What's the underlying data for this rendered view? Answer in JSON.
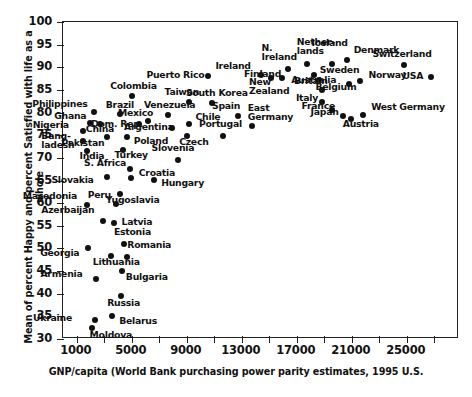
{
  "chart_data": {
    "type": "scatter",
    "title": "",
    "xlabel": "GNP/capita (World Bank purchasing power parity estimates, 1995 U.S.",
    "ylabel": "Mean of percent Happy and percent Satisfied with life as a whole",
    "xlim": [
      0,
      28800
    ],
    "ylim": [
      30,
      100
    ],
    "grid": false,
    "legend": "none",
    "xticks_labeled": [
      "1000",
      "5000",
      "9000",
      "13000",
      "17000",
      "21000",
      "25000"
    ],
    "xtick_values_labeled": [
      1000,
      5000,
      9000,
      13000,
      17000,
      21000,
      25000
    ],
    "xtick_minor_interval": 2000,
    "yticks": [
      "30",
      "35",
      "40",
      "45",
      "50",
      "55",
      "60",
      "65",
      "70",
      "75",
      "80",
      "85",
      "90",
      "95",
      "100"
    ],
    "ytick_values": [
      30,
      35,
      40,
      45,
      50,
      55,
      60,
      65,
      70,
      75,
      80,
      85,
      90,
      95,
      100
    ],
    "point_color": "#111111",
    "marker": "filled-circle",
    "points": [
      {
        "label": "Moldova",
        "x": 2150,
        "y": 32.3,
        "lx": -2,
        "ly": 7,
        "anchor": "left"
      },
      {
        "label": "Ukraine",
        "x": 2400,
        "y": 33.9,
        "lx": -62,
        "ly": -2,
        "anchor": "left"
      },
      {
        "label": "Belarus",
        "x": 3650,
        "y": 34.8,
        "lx": 7,
        "ly": 5,
        "anchor": "left"
      },
      {
        "label": "Russia",
        "x": 4300,
        "y": 39.2,
        "lx": -14,
        "ly": 7,
        "anchor": "left"
      },
      {
        "label": "Armenia",
        "x": 2500,
        "y": 43.0,
        "lx": -56,
        "ly": -5,
        "anchor": "left"
      },
      {
        "label": "Bulgaria",
        "x": 4350,
        "y": 44.7,
        "lx": 4,
        "ly": 6,
        "anchor": "left"
      },
      {
        "label": "Lithuania",
        "x": 3550,
        "y": 48.2,
        "lx": -18,
        "ly": 6,
        "anchor": "left"
      },
      {
        "label": "Romania",
        "x": 4750,
        "y": 47.8,
        "lx": 0,
        "ly": -12,
        "anchor": "left"
      },
      {
        "label": "Georgia",
        "x": 1900,
        "y": 49.8,
        "lx": -48,
        "ly": 5,
        "anchor": "left"
      },
      {
        "label": "Estonia",
        "x": 4500,
        "y": 50.8,
        "lx": -10,
        "ly": -12,
        "anchor": "left"
      },
      {
        "label": "Latvia",
        "x": 3750,
        "y": 55.3,
        "lx": 8,
        "ly": -1,
        "anchor": "left"
      },
      {
        "label": "Azerbaijan",
        "x": 3000,
        "y": 55.8,
        "lx": -62,
        "ly": -11,
        "anchor": "left"
      },
      {
        "label": "Macedonia",
        "x": 1800,
        "y": 59.3,
        "lx": -64,
        "ly": -9,
        "anchor": "left"
      },
      {
        "label": "Peru",
        "x": 3900,
        "y": 59.5,
        "lx": -28,
        "ly": -9,
        "anchor": "left"
      },
      {
        "label": "Yugoslavia",
        "x": 4200,
        "y": 61.7,
        "lx": -14,
        "ly": 6,
        "anchor": "left"
      },
      {
        "label": "Slovakia",
        "x": 3300,
        "y": 65.5,
        "lx": -56,
        "ly": 3,
        "anchor": "left"
      },
      {
        "label": "Hungary",
        "x": 6700,
        "y": 64.8,
        "lx": 7,
        "ly": 3,
        "anchor": "left"
      },
      {
        "label": "Croatia",
        "x": 5000,
        "y": 65.4,
        "lx": 8,
        "ly": -5,
        "anchor": "left"
      },
      {
        "label": "S. Africa",
        "x": 4950,
        "y": 67.3,
        "lx": -46,
        "ly": -6,
        "anchor": "left"
      },
      {
        "label": "Turkey",
        "x": 4400,
        "y": 71.6,
        "lx": -8,
        "ly": 5,
        "anchor": "left"
      },
      {
        "label": "Slovenia",
        "x": 8400,
        "y": 69.3,
        "lx": -26,
        "ly": -12,
        "anchor": "left"
      },
      {
        "label": "India",
        "x": 1850,
        "y": 71.4,
        "lx": -8,
        "ly": 5,
        "anchor": "left"
      },
      {
        "label": "Bang-\nladesh",
        "x": 1550,
        "y": 73.5,
        "lx": -42,
        "ly": -5,
        "anchor": "left"
      },
      {
        "label": "Pakistan",
        "x": 3300,
        "y": 74.3,
        "lx": -46,
        "ly": 6,
        "anchor": "left"
      },
      {
        "label": "Poland",
        "x": 4700,
        "y": 74.4,
        "lx": 7,
        "ly": 4,
        "anchor": "left"
      },
      {
        "label": "Nigeria",
        "x": 1500,
        "y": 75.7,
        "lx": -50,
        "ly": -6,
        "anchor": "left"
      },
      {
        "label": "Czech",
        "x": 9100,
        "y": 74.7,
        "lx": -8,
        "ly": 6,
        "anchor": "left"
      },
      {
        "label": "Argentina",
        "x": 8000,
        "y": 76.4,
        "lx": -48,
        "ly": -1,
        "anchor": "left"
      },
      {
        "label": "Portugal",
        "x": 11700,
        "y": 74.6,
        "lx": -24,
        "ly": -12,
        "anchor": "left"
      },
      {
        "label": "Chile",
        "x": 9200,
        "y": 77.2,
        "lx": 7,
        "ly": -7,
        "anchor": "left"
      },
      {
        "label": "Dom. Rep.",
        "x": 5600,
        "y": 77.2,
        "lx": -48,
        "ly": 0,
        "anchor": "left"
      },
      {
        "label": "China",
        "x": 2750,
        "y": 77.3,
        "lx": -14,
        "ly": 5,
        "anchor": "left"
      },
      {
        "label": "Ghana",
        "x": 2050,
        "y": 77.4,
        "lx": -36,
        "ly": -7,
        "anchor": "left"
      },
      {
        "label": "Mexico",
        "x": 6250,
        "y": 78.0,
        "lx": -30,
        "ly": -8,
        "anchor": "left"
      },
      {
        "label": "Venezuela",
        "x": 7700,
        "y": 79.2,
        "lx": -24,
        "ly": -10,
        "anchor": "left"
      },
      {
        "label": "Brazil",
        "x": 4200,
        "y": 79.4,
        "lx": -14,
        "ly": -9,
        "anchor": "left"
      },
      {
        "label": "Philippines",
        "x": 2350,
        "y": 79.9,
        "lx": -62,
        "ly": -8,
        "anchor": "left"
      },
      {
        "label": "East\nGermany",
        "x": 13800,
        "y": 76.9,
        "lx": -4,
        "ly": -18,
        "anchor": "left"
      },
      {
        "label": "Spain",
        "x": 12800,
        "y": 79.0,
        "lx": -26,
        "ly": -10,
        "anchor": "left"
      },
      {
        "label": "Colombia",
        "x": 5100,
        "y": 83.4,
        "lx": -22,
        "ly": -10,
        "anchor": "left"
      },
      {
        "label": "Taiwan",
        "x": 9200,
        "y": 82.2,
        "lx": -24,
        "ly": -10,
        "anchor": "left"
      },
      {
        "label": "South Korea",
        "x": 10900,
        "y": 82.0,
        "lx": -26,
        "ly": -10,
        "anchor": "left"
      },
      {
        "label": "Puerto Rico",
        "x": 10650,
        "y": 87.9,
        "lx": -62,
        "ly": -1,
        "anchor": "left"
      },
      {
        "label": "Ireland",
        "x": 14500,
        "y": 88.0,
        "lx": -46,
        "ly": -9,
        "anchor": "left"
      },
      {
        "label": "New\nZealand",
        "x": 15200,
        "y": 87.5,
        "lx": -22,
        "ly": 4,
        "anchor": "left"
      },
      {
        "label": "N.\nIreland",
        "x": 16400,
        "y": 89.4,
        "lx": -26,
        "ly": -21,
        "anchor": "left"
      },
      {
        "label": "Finland",
        "x": 16000,
        "y": 87.5,
        "lx": -38,
        "ly": -4,
        "anchor": "left"
      },
      {
        "label": "Nether-\nlands",
        "x": 17800,
        "y": 90.5,
        "lx": -10,
        "ly": -22,
        "anchor": "left"
      },
      {
        "label": "Sweden",
        "x": 18300,
        "y": 88.0,
        "lx": 6,
        "ly": -5,
        "anchor": "left"
      },
      {
        "label": "Australia",
        "x": 18700,
        "y": 87.0,
        "lx": -28,
        "ly": 0,
        "anchor": "left"
      },
      {
        "label": "Iceland",
        "x": 19600,
        "y": 90.4,
        "lx": -20,
        "ly": -21,
        "anchor": "left"
      },
      {
        "label": "Denmark",
        "x": 20700,
        "y": 91.3,
        "lx": 7,
        "ly": -10,
        "anchor": "left"
      },
      {
        "label": "Britain",
        "x": 18900,
        "y": 84.7,
        "lx": -28,
        "ly": -9,
        "anchor": "left"
      },
      {
        "label": "Italy",
        "x": 18900,
        "y": 82.1,
        "lx": -26,
        "ly": -4,
        "anchor": "left"
      },
      {
        "label": "France",
        "x": 19600,
        "y": 80.3,
        "lx": -30,
        "ly": -4,
        "anchor": "left"
      },
      {
        "label": "Japan",
        "x": 20400,
        "y": 79.0,
        "lx": -32,
        "ly": -4,
        "anchor": "left"
      },
      {
        "label": "Austria",
        "x": 21000,
        "y": 78.3,
        "lx": -8,
        "ly": 5,
        "anchor": "left"
      },
      {
        "label": "West Germany",
        "x": 21900,
        "y": 79.3,
        "lx": 8,
        "ly": -8,
        "anchor": "left"
      },
      {
        "label": "Belgium",
        "x": 20900,
        "y": 86.0,
        "lx": -34,
        "ly": 3,
        "anchor": "left"
      },
      {
        "label": "Norway",
        "x": 21700,
        "y": 86.8,
        "lx": 8,
        "ly": -6,
        "anchor": "left"
      },
      {
        "label": "Switzerland",
        "x": 24900,
        "y": 90.2,
        "lx": -32,
        "ly": -11,
        "anchor": "left"
      },
      {
        "label": "USA",
        "x": 26800,
        "y": 87.7,
        "lx": -28,
        "ly": -1,
        "anchor": "left"
      }
    ]
  },
  "figure": {
    "footer_note": ""
  }
}
